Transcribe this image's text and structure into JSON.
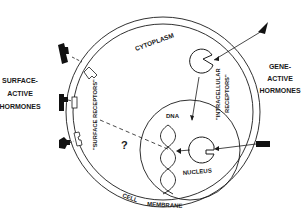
{
  "diagram": {
    "labels": {
      "cytoplasm": "CYTOPLASM",
      "surface_receptors": "\"SURFACE RECEPTORS\"",
      "intracellular_receptors": "\"INTRACELLULAR RECEPTORS\"",
      "intracellular_line1": "\"INTRACELLULAR",
      "intracellular_line2": "RECEPTORS\"",
      "dna": "DNA",
      "nucleus": "NUCLEUS",
      "question": "?",
      "cell": "CELL",
      "membrane": "MEMBRANE",
      "surface_active": [
        "SURFACE-",
        "ACTIVE",
        "HORMONES"
      ],
      "gene_active": [
        "GENE-",
        "ACTIVE",
        "HORMONES"
      ]
    },
    "colors": {
      "ink": "#1a1a1a",
      "background": "#ffffff"
    }
  }
}
